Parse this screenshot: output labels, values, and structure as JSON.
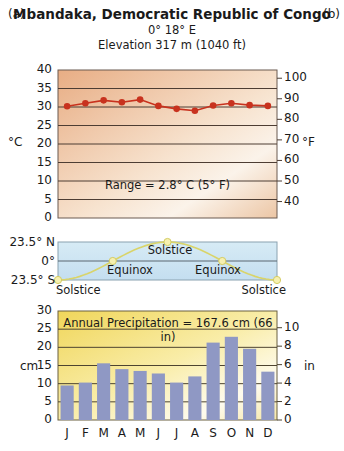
{
  "header": {
    "panel_a": "(a)",
    "panel_b": "(b)",
    "title": "Mbandaka, Democratic Republic of Congo",
    "coords": "0°  18° E",
    "elevation": "Elevation 317 m (1040 ft)"
  },
  "colors": {
    "temp_line": "#c8321e",
    "temp_bg_dark": "#e9b48f",
    "temp_bg_light": "#faf1e6",
    "sun_bg": "#cfe6f2",
    "sun_line": "#d9d46a",
    "precip_bar": "#8f98c4",
    "precip_bg_dark": "#f2dc6a",
    "precip_bg_light": "#fdf9e8",
    "grid": "#4a3a30"
  },
  "temperature": {
    "left_unit": "°C",
    "right_unit": "°F",
    "left_ticks": [
      "40",
      "35",
      "30",
      "25",
      "20",
      "15",
      "10",
      "5",
      "0"
    ],
    "right_ticks": [
      "100",
      "90",
      "80",
      "70",
      "60",
      "50",
      "40"
    ],
    "range_note": "Range = 2.8° C (5° F)"
  },
  "sun": {
    "ticks": [
      "23.5° N",
      "0°",
      "23.5° S"
    ],
    "labels": {
      "solstice_top": "Solstice",
      "equinox_1": "Equinox",
      "equinox_2": "Equinox",
      "solstice_left": "Solstice",
      "solstice_right": "Solstice"
    }
  },
  "precipitation": {
    "left_unit": "cm",
    "right_unit": "in",
    "left_ticks": [
      "30",
      "25",
      "20",
      "15",
      "10",
      "5",
      "0"
    ],
    "right_ticks": [
      "10",
      "8",
      "6",
      "4",
      "2",
      "0"
    ],
    "annual_note": "Annual Precipitation = 167.6 cm (66 in)"
  },
  "months": [
    "J",
    "F",
    "M",
    "A",
    "M",
    "J",
    "J",
    "A",
    "S",
    "O",
    "N",
    "D"
  ],
  "chart_data": [
    {
      "type": "line",
      "title": "Mbandaka, Democratic Republic of Congo — Monthly Temperature",
      "categories": [
        "J",
        "F",
        "M",
        "A",
        "M",
        "J",
        "J",
        "A",
        "S",
        "O",
        "N",
        "D"
      ],
      "series": [
        {
          "name": "Temperature (°C)",
          "values": [
            30.2,
            31.0,
            31.8,
            31.3,
            32.0,
            30.3,
            29.5,
            29.0,
            30.4,
            31.0,
            30.5,
            30.3
          ]
        }
      ],
      "ylabel": "°C",
      "ylim": [
        0,
        40
      ],
      "secondary_ylabel": "°F",
      "secondary_ylim": [
        32,
        104
      ],
      "annotation": "Range = 2.8° C (5° F)",
      "grid": true
    },
    {
      "type": "line",
      "title": "Subsolar point latitude through the year",
      "categories": [
        "Dec",
        "Mar",
        "Jun",
        "Sep",
        "Dec"
      ],
      "series": [
        {
          "name": "Sun declination (°)",
          "values": [
            -23.5,
            0,
            23.5,
            0,
            -23.5
          ]
        }
      ],
      "ylabel": "Latitude",
      "yticks": [
        "23.5° N",
        "0°",
        "23.5° S"
      ],
      "annotations": [
        "Solstice",
        "Equinox",
        "Solstice",
        "Equinox",
        "Solstice"
      ]
    },
    {
      "type": "bar",
      "title": "Monthly Precipitation",
      "categories": [
        "J",
        "F",
        "M",
        "A",
        "M",
        "J",
        "J",
        "A",
        "S",
        "O",
        "N",
        "D"
      ],
      "values": [
        9.5,
        10.3,
        15.6,
        14.0,
        13.5,
        12.8,
        10.3,
        12.0,
        21.3,
        22.9,
        19.6,
        13.3
      ],
      "ylabel": "cm",
      "ylim": [
        0,
        30
      ],
      "secondary_ylabel": "in",
      "secondary_ylim": [
        0,
        11.8
      ],
      "annotation": "Annual Precipitation = 167.6 cm (66 in)",
      "grid": true
    }
  ]
}
